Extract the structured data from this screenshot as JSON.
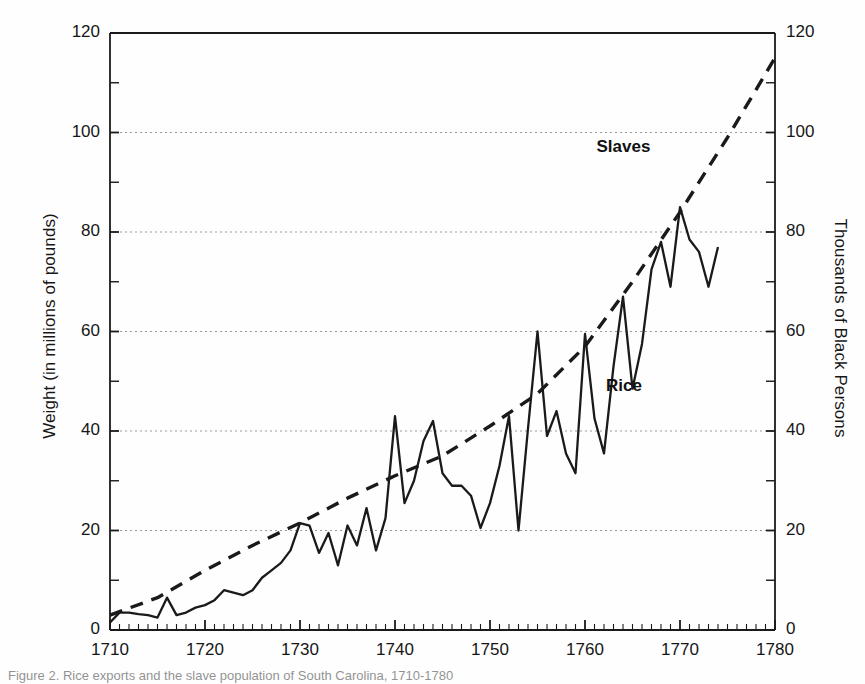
{
  "figure": {
    "title": "",
    "caption_partial": "Figure 2. Rice exports and the slave population of South Carolina, 1710-1780"
  },
  "axes": {
    "x": {
      "label": "",
      "min": 1710,
      "max": 1780,
      "major_ticks": [
        1710,
        1720,
        1730,
        1740,
        1750,
        1760,
        1770,
        1780
      ],
      "minor_tick_step": 1
    },
    "y_left": {
      "label": "Weight (in millions of pounds)",
      "min": 0,
      "max": 120,
      "major_ticks": [
        0,
        20,
        40,
        60,
        80,
        100,
        120
      ],
      "minor_tick_step": 10
    },
    "y_right": {
      "label": "Thousands of Black Persons",
      "min": 0,
      "max": 120,
      "major_ticks": [
        0,
        20,
        40,
        60,
        80,
        100,
        120
      ],
      "minor_tick_step": 10
    },
    "gridlines": [
      20,
      40,
      60,
      80,
      100
    ]
  },
  "annotations": [
    {
      "name": "slaves-label",
      "text": "Slaves",
      "x": 1765,
      "y": 97
    },
    {
      "name": "rice-label",
      "text": "Rice",
      "x": 1766,
      "y": 49
    }
  ],
  "chart_data": {
    "type": "line",
    "title": "",
    "xlabel": "",
    "ylabel": "Weight (in millions of pounds)",
    "ylabel_secondary": "Thousands of Black Persons",
    "xlim": [
      1710,
      1780
    ],
    "ylim": [
      0,
      120
    ],
    "grid": true,
    "legend": "inline-annotations",
    "series": [
      {
        "name": "Rice",
        "axis": "left",
        "units": "millions of pounds",
        "style": "solid",
        "color": "#1a1a1a",
        "x": [
          1710,
          1711,
          1712,
          1713,
          1714,
          1715,
          1716,
          1717,
          1718,
          1719,
          1720,
          1721,
          1722,
          1723,
          1724,
          1725,
          1726,
          1727,
          1728,
          1729,
          1730,
          1731,
          1732,
          1733,
          1734,
          1735,
          1736,
          1737,
          1738,
          1739,
          1740,
          1741,
          1742,
          1743,
          1744,
          1745,
          1746,
          1747,
          1748,
          1749,
          1750,
          1751,
          1752,
          1753,
          1754,
          1755,
          1756,
          1757,
          1758,
          1759,
          1760,
          1761,
          1762,
          1763,
          1764,
          1765,
          1766,
          1767,
          1768,
          1769,
          1770,
          1771,
          1772,
          1773,
          1774
        ],
        "values": [
          1.5,
          3.5,
          3.5,
          3.2,
          3.0,
          2.5,
          6.5,
          3.0,
          3.5,
          4.5,
          5.0,
          6.0,
          8.0,
          7.5,
          7.0,
          8.0,
          10.5,
          12.0,
          13.5,
          16.0,
          21.5,
          21.0,
          15.5,
          19.5,
          13.0,
          21.0,
          17.0,
          24.5,
          16.0,
          22.5,
          43.0,
          25.5,
          30.0,
          38.0,
          42.0,
          31.5,
          29.0,
          29.0,
          27.0,
          20.5,
          25.5,
          33.0,
          43.0,
          20.0,
          40.5,
          60.0,
          39.0,
          44.0,
          35.5,
          31.5,
          59.5,
          42.5,
          35.5,
          53.0,
          67.0,
          48.5,
          57.5,
          72.5,
          78.0,
          69.0,
          85.0,
          78.5,
          76.0,
          69.0,
          77.0
        ]
      },
      {
        "name": "Slaves",
        "axis": "right",
        "units": "thousands of black persons",
        "style": "dashed",
        "color": "#1a1a1a",
        "x": [
          1710,
          1715,
          1720,
          1725,
          1730,
          1735,
          1740,
          1745,
          1750,
          1755,
          1760,
          1765,
          1770,
          1775,
          1780
        ],
        "values": [
          3.0,
          6.5,
          12.0,
          17.0,
          21.5,
          26.5,
          31.0,
          35.0,
          41.0,
          47.5,
          57.0,
          70.0,
          84.0,
          99.0,
          115.0
        ]
      }
    ]
  },
  "colors": {
    "ink": "#1a1a1a",
    "grid": "#9a9a9a",
    "background": "#ffffff"
  }
}
